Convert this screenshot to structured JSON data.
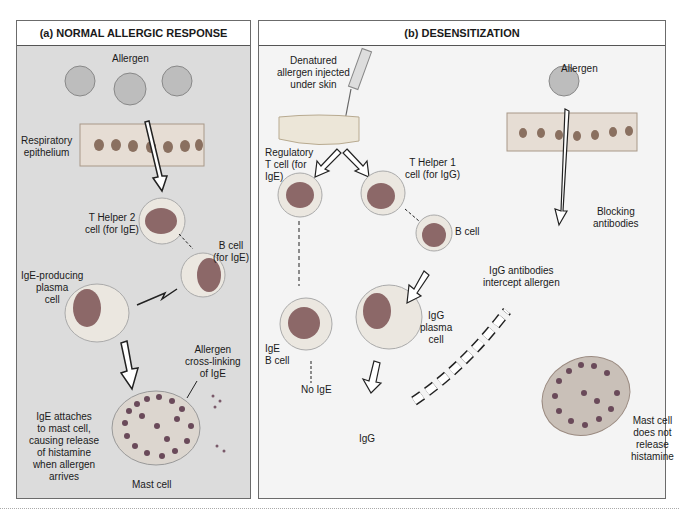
{
  "figure": {
    "panels": [
      {
        "id": "a",
        "title": "(a)  NORMAL ALLERGIC RESPONSE",
        "labels": {
          "allergen": "Allergen",
          "respiratory_epithelium": [
            "Respiratory",
            "epithelium"
          ],
          "t_helper_2": [
            "T Helper 2",
            "cell (for IgE)"
          ],
          "b_cell": [
            "B cell",
            "(for IgE)"
          ],
          "plasma_cell": [
            "IgE-producing",
            "plasma",
            "cell"
          ],
          "cross_linking": [
            "Allergen",
            "cross-linking",
            "of IgE"
          ],
          "ige_attaches": [
            "IgE attaches",
            "to mast cell,",
            "causing release",
            "of histamine",
            "when allergen",
            "arrives"
          ],
          "mast_cell": "Mast cell"
        }
      },
      {
        "id": "b",
        "title": "(b)  DESENSITIZATION",
        "labels": {
          "injection": [
            "Denatured",
            "allergen injected",
            "under skin"
          ],
          "regulatory_t": [
            "Regulatory",
            "T cell (for",
            "IgE)"
          ],
          "t_helper_1": [
            "T Helper 1",
            "cell (for IgG)"
          ],
          "b_cell": "B cell",
          "allergen": "Allergen",
          "blocking": [
            "Blocking",
            "antibodies"
          ],
          "igg_intercept": [
            "IgG antibodies",
            "intercept allergen"
          ],
          "ige_b_cell": [
            "IgE",
            "B cell"
          ],
          "no_ige": "No IgE",
          "igg_plasma": [
            "IgG",
            "plasma",
            "cell"
          ],
          "igg": "IgG",
          "mast_no_release": [
            "Mast cell",
            "does not",
            "release",
            "histamine"
          ]
        }
      }
    ],
    "colors": {
      "panel_a_bg": "#dcdcdc",
      "panel_b_bg": "#f4f4f4",
      "nucleus": "#8a6a6a",
      "cell": "#e8e4de",
      "granule": "#6a4a5a"
    }
  }
}
